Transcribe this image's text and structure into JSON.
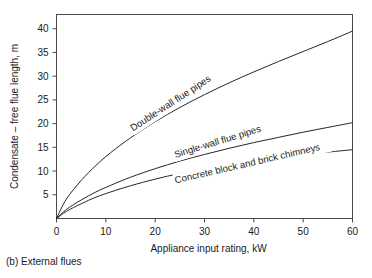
{
  "caption": "(b) External flues",
  "colors": {
    "background": "#ffffff",
    "frame": "#4a4a4a",
    "curve": "#262626",
    "text": "#1a1a1a"
  },
  "chart_data": {
    "type": "line",
    "title": "",
    "xlabel": "Appliance input rating, kW",
    "ylabel": "Condensate – free flue length, m",
    "xlim": [
      0,
      60
    ],
    "ylim": [
      0,
      43
    ],
    "xticks": [
      0,
      10,
      20,
      30,
      40,
      50,
      60
    ],
    "yticks": [
      5,
      10,
      15,
      20,
      25,
      30,
      35,
      40
    ],
    "xtick_labels": [
      "0",
      "10",
      "20",
      "30",
      "40",
      "50",
      "60"
    ],
    "ytick_labels": [
      "5",
      "10",
      "15",
      "20",
      "25",
      "30",
      "35",
      "40"
    ],
    "grid": false,
    "legend_position": "inline-along-curves",
    "x": [
      0,
      2,
      5,
      8,
      11,
      15,
      20,
      25,
      30,
      35,
      40,
      45,
      50,
      55,
      60
    ],
    "series": [
      {
        "name": "Double-wall flue pipes",
        "label": "Double-wall flue pipes",
        "values": [
          0,
          4.1,
          8.0,
          11.2,
          13.9,
          17.0,
          20.4,
          23.4,
          26.1,
          28.6,
          30.9,
          33.1,
          35.2,
          37.3,
          39.5
        ]
      },
      {
        "name": "Single-wall flue pipes",
        "label": "Single-wall flue pipes",
        "values": [
          0,
          1.9,
          3.9,
          5.6,
          7.0,
          8.7,
          10.5,
          12.1,
          13.5,
          14.8,
          16.0,
          17.1,
          18.2,
          19.2,
          20.2
        ]
      },
      {
        "name": "Concrete block and brick chimneys",
        "label": "Concrete block and brick chimneys",
        "values": [
          0,
          1.5,
          3.1,
          4.5,
          5.6,
          6.9,
          8.3,
          9.5,
          10.5,
          11.4,
          12.2,
          12.9,
          13.5,
          14.0,
          14.5
        ]
      }
    ]
  }
}
